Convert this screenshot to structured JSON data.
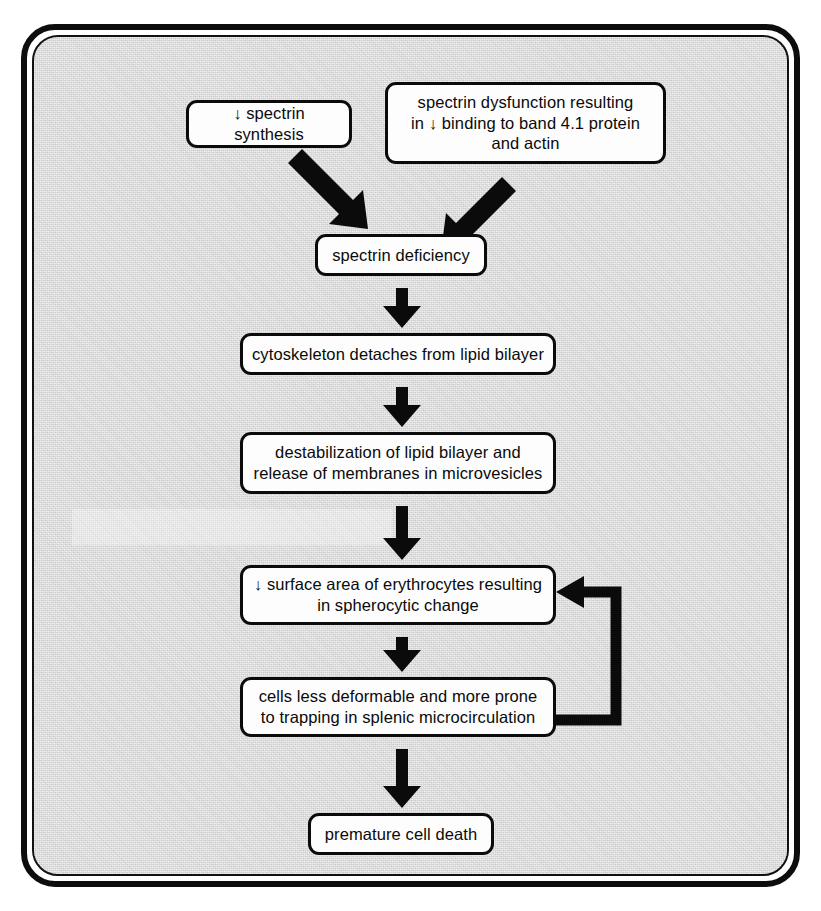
{
  "figure": {
    "type": "flowchart",
    "background_color": "#d6d6d6",
    "node_fill_color": "#fdfdfd",
    "line_color": "#0b0b0b"
  },
  "nodes": {
    "spectrin_synthesis": "↓ spectrin synthesis",
    "spectrin_dysfunction": "spectrin dysfunction resulting\nin ↓ binding to band 4.1 protein\nand actin",
    "spectrin_deficiency": "spectrin deficiency",
    "cytoskeleton": "cytoskeleton detaches from lipid bilayer",
    "destabilization": "destabilization of lipid bilayer and\nrelease of membranes in microvesicles",
    "surface_area": "↓ surface area of erythrocytes resulting\nin spherocytic change",
    "cells_deformable": "cells less deformable and more prone\nto trapping in splenic microcirculation",
    "premature_death": "premature cell death"
  },
  "edges": [
    {
      "id": "e1",
      "from": "spectrin_synthesis",
      "to": "spectrin_deficiency",
      "style": "diagonal-down-right"
    },
    {
      "id": "e2",
      "from": "spectrin_dysfunction",
      "to": "spectrin_deficiency",
      "style": "diagonal-down-left"
    },
    {
      "id": "e3",
      "from": "spectrin_deficiency",
      "to": "cytoskeleton",
      "style": "vertical-down"
    },
    {
      "id": "e4",
      "from": "cytoskeleton",
      "to": "destabilization",
      "style": "vertical-down"
    },
    {
      "id": "e5",
      "from": "destabilization",
      "to": "surface_area",
      "style": "vertical-down"
    },
    {
      "id": "e6",
      "from": "surface_area",
      "to": "cells_deformable",
      "style": "vertical-down"
    },
    {
      "id": "e7",
      "from": "cells_deformable",
      "to": "premature_death",
      "style": "vertical-down"
    },
    {
      "id": "e8",
      "from": "cells_deformable",
      "to": "surface_area",
      "style": "feedback-loop-right"
    }
  ]
}
